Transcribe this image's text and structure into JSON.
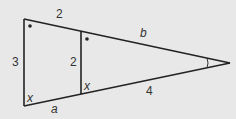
{
  "diagram": {
    "background": "#e8e8e8",
    "stroke_color": "#222222",
    "labels": {
      "top_left_segment": "2",
      "top_right_segment": "b",
      "left_side": "3",
      "inner_side": "2",
      "bottom_left_segment": "a",
      "bottom_right_segment": "4",
      "angle_bottom_left": "x",
      "angle_inner_bottom": "x"
    },
    "markers": {
      "top_left_angle": "dot",
      "inner_top_angle": "dot",
      "apex_angle": "arc"
    }
  }
}
